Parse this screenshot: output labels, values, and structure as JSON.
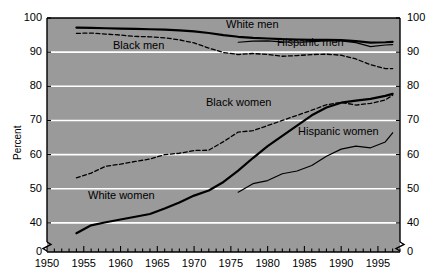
{
  "chart_data": {
    "type": "line",
    "title": "",
    "xlabel": "",
    "ylabel": "Percent",
    "xlim": [
      1950,
      1998
    ],
    "ylim": [
      35,
      100
    ],
    "axis_break": true,
    "axis_break_note": "y axis broken between 0 and 35",
    "grid": true,
    "grid_color": "#ffffff",
    "plot_background": "#9a9a9a",
    "legend_position": "inline-labels",
    "y_ticks_left": [
      "100",
      "90",
      "80",
      "70",
      "60",
      "50",
      "40",
      "0"
    ],
    "y_ticks_right": [
      "100",
      "90",
      "80",
      "70",
      "60",
      "50",
      "40",
      "0"
    ],
    "y_tick_values": [
      100,
      90,
      80,
      70,
      60,
      50,
      40,
      0
    ],
    "x_ticks": [
      "1950",
      "1955",
      "1960",
      "1965",
      "1970",
      "1975",
      "1980",
      "1985",
      "1990",
      "1995"
    ],
    "x_tick_values": [
      1950,
      1955,
      1960,
      1965,
      1970,
      1975,
      1980,
      1985,
      1990,
      1995
    ],
    "x_minor_tick_interval": 1,
    "series": [
      {
        "name": "White men",
        "style": "solid-thick",
        "color": "#000000",
        "label_text": "White men",
        "x": [
          1954,
          1956,
          1958,
          1960,
          1962,
          1964,
          1966,
          1968,
          1970,
          1972,
          1974,
          1976,
          1978,
          1980,
          1982,
          1984,
          1986,
          1988,
          1990,
          1992,
          1994,
          1996,
          1997
        ],
        "values": [
          97.2,
          97.1,
          97.0,
          96.9,
          96.8,
          96.7,
          96.6,
          96.4,
          96.1,
          95.6,
          95.0,
          94.5,
          94.2,
          94.0,
          93.8,
          93.7,
          93.6,
          93.6,
          93.5,
          93.2,
          92.8,
          92.9,
          93.0
        ]
      },
      {
        "name": "Black men",
        "style": "dashed",
        "color": "#000000",
        "label_text": "Black men",
        "x": [
          1954,
          1956,
          1958,
          1960,
          1962,
          1964,
          1966,
          1968,
          1970,
          1972,
          1974,
          1976,
          1978,
          1980,
          1982,
          1984,
          1986,
          1988,
          1990,
          1992,
          1994,
          1996,
          1997
        ],
        "values": [
          95.5,
          95.6,
          95.3,
          95.0,
          94.6,
          94.5,
          94.2,
          93.6,
          92.7,
          91.2,
          89.9,
          89.3,
          89.6,
          89.3,
          88.8,
          89.0,
          89.3,
          89.4,
          89.1,
          88.0,
          86.3,
          85.2,
          85.2
        ]
      },
      {
        "name": "Hispanic men",
        "style": "solid-thin",
        "color": "#000000",
        "label_text": "Hispanic men",
        "x": [
          1976,
          1978,
          1980,
          1982,
          1984,
          1986,
          1988,
          1990,
          1992,
          1994,
          1996,
          1997
        ],
        "values": [
          92.9,
          93.2,
          93.3,
          93.0,
          92.9,
          93.1,
          93.3,
          93.3,
          92.8,
          91.6,
          92.1,
          92.2
        ]
      },
      {
        "name": "White women",
        "style": "solid-thick",
        "color": "#000000",
        "label_text": "White women",
        "x": [
          1954,
          1956,
          1958,
          1960,
          1962,
          1964,
          1966,
          1968,
          1970,
          1972,
          1974,
          1976,
          1978,
          1980,
          1982,
          1984,
          1986,
          1988,
          1990,
          1992,
          1994,
          1996,
          1997
        ],
        "values": [
          37.0,
          39.3,
          40.2,
          41.0,
          41.8,
          42.6,
          44.2,
          46.0,
          48.0,
          49.5,
          52.0,
          55.3,
          59.0,
          62.5,
          65.5,
          68.5,
          71.5,
          73.8,
          75.2,
          75.8,
          76.3,
          77.2,
          77.8
        ]
      },
      {
        "name": "Black women",
        "style": "dashed",
        "color": "#000000",
        "label_text": "Black women",
        "x": [
          1954,
          1956,
          1958,
          1960,
          1962,
          1964,
          1966,
          1968,
          1970,
          1972,
          1974,
          1976,
          1978,
          1980,
          1982,
          1984,
          1986,
          1988,
          1990,
          1992,
          1994,
          1996,
          1997
        ],
        "values": [
          53.2,
          54.6,
          56.6,
          57.2,
          58.0,
          58.7,
          60.0,
          60.4,
          61.2,
          61.3,
          63.8,
          66.6,
          67.0,
          68.5,
          70.0,
          71.5,
          73.0,
          74.6,
          75.3,
          74.5,
          75.0,
          76.0,
          77.4
        ]
      },
      {
        "name": "Hispanic women",
        "style": "solid-thin",
        "color": "#000000",
        "label_text": "Hispanic women",
        "x": [
          1976,
          1978,
          1980,
          1982,
          1984,
          1986,
          1988,
          1990,
          1992,
          1994,
          1996,
          1997
        ],
        "values": [
          49.0,
          51.5,
          52.4,
          54.4,
          55.2,
          56.8,
          59.5,
          61.6,
          62.5,
          62.0,
          63.7,
          66.4
        ]
      }
    ]
  },
  "axis": {
    "y_label": "Percent"
  }
}
